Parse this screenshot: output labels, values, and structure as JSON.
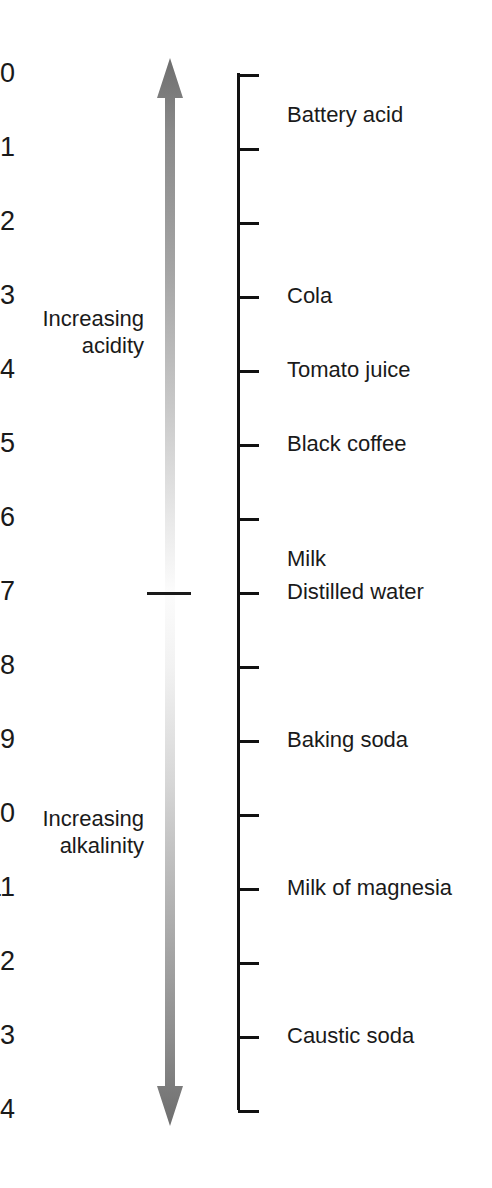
{
  "figure": {
    "type": "annotated-scale-diagram"
  },
  "chart_data": {
    "type": "scatter",
    "xlabel": "",
    "ylabel": "pH",
    "ylim": [
      0,
      14
    ],
    "orientation": "vertical",
    "axis_direction": "top-is-zero",
    "grid": false,
    "legend": null,
    "tick_labels": [
      "0",
      "1",
      "2",
      "3",
      "4",
      "5",
      "6",
      "7",
      "8",
      "9",
      "10",
      "11",
      "12",
      "13",
      "14"
    ],
    "tick_values": [
      0,
      1,
      2,
      3,
      4,
      5,
      6,
      7,
      8,
      9,
      10,
      11,
      12,
      13,
      14
    ],
    "categories": [
      "Battery acid",
      "Cola",
      "Tomato juice",
      "Black coffee",
      "Milk",
      "Distilled water",
      "Baking soda",
      "Milk of magnesia",
      "Caustic soda"
    ],
    "values": [
      0.55,
      3.0,
      4.0,
      5.0,
      6.55,
      7.0,
      9.0,
      11.0,
      13.0
    ],
    "annotations": [
      {
        "label": "Increasing acidity",
        "span": [
          0,
          7
        ],
        "direction": "up"
      },
      {
        "label": "Increasing alkalinity",
        "span": [
          7,
          14
        ],
        "direction": "down"
      },
      {
        "label": "neutral marker",
        "value": 7
      }
    ]
  },
  "ticks": [
    {
      "label": "0",
      "ph": 0
    },
    {
      "label": "1",
      "ph": 1
    },
    {
      "label": "2",
      "ph": 2
    },
    {
      "label": "3",
      "ph": 3
    },
    {
      "label": "4",
      "ph": 4
    },
    {
      "label": "5",
      "ph": 5
    },
    {
      "label": "6",
      "ph": 6
    },
    {
      "label": "7",
      "ph": 7
    },
    {
      "label": "8",
      "ph": 8
    },
    {
      "label": "9",
      "ph": 9
    },
    {
      "label": "10",
      "ph": 10
    },
    {
      "label": "11",
      "ph": 11
    },
    {
      "label": "12",
      "ph": 12
    },
    {
      "label": "13",
      "ph": 13
    },
    {
      "label": "14",
      "ph": 14
    }
  ],
  "substances": [
    {
      "label": "Battery acid",
      "ph": 0.55
    },
    {
      "label": "Cola",
      "ph": 3.0
    },
    {
      "label": "Tomato juice",
      "ph": 4.0
    },
    {
      "label": "Black coffee",
      "ph": 5.0
    },
    {
      "label": "Milk",
      "ph": 6.55
    },
    {
      "label": "Distilled water",
      "ph": 7.0
    },
    {
      "label": "Baking soda",
      "ph": 9.0
    },
    {
      "label": "Milk of magnesia",
      "ph": 11.0
    },
    {
      "label": "Caustic soda",
      "ph": 13.0
    }
  ],
  "side_labels": {
    "acidity": "Increasing\nacidity",
    "alkalinity": "Increasing\nalkalinity"
  },
  "colors": {
    "axis": "#111111",
    "text": "#1a1a1a",
    "arrow_dark": "#6e6e6e",
    "arrow_mid": "#b5b5b5",
    "arrow_light": "#fbfbfb",
    "background": "#ffffff"
  },
  "geometry": {
    "ph0_y": 74,
    "ph_step_px": 74.0
  }
}
